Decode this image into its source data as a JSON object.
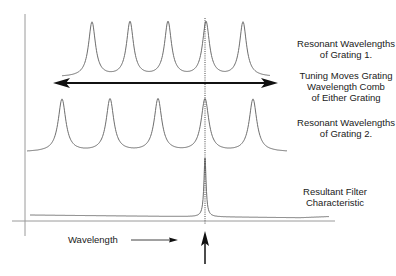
{
  "diagram": {
    "colors": {
      "curve": "#6e6e6e",
      "axis": "#9a9a9a",
      "arrow": "#111111",
      "text": "#1a1a1a"
    },
    "labels": {
      "grating1": [
        "Resonant Wavelengths",
        "of Grating 1."
      ],
      "tuning": [
        "Tuning Moves Grating",
        "Wavelength Comb",
        "of Either Grating"
      ],
      "grating2": [
        "Resonant Wavelengths",
        "of Grating 2."
      ],
      "resultant": [
        "Resultant Filter",
        "Characteristic"
      ],
      "x_axis": "Wavelength"
    },
    "combs": {
      "grating1": {
        "peaks_x": [
          92,
          130,
          168,
          206,
          243
        ],
        "peak_y": 20,
        "base_y": 75,
        "start_x": 62,
        "end_x": 270
      },
      "grating2": {
        "peaks_x": [
          62,
          110,
          158,
          205,
          253
        ],
        "peak_y": 97,
        "base_y": 150,
        "start_x": 27,
        "end_x": 287
      },
      "resultant": {
        "peak_x": 205,
        "peak_y": 158,
        "base_y": 218,
        "start_x": 30,
        "end_x": 329
      }
    },
    "alignment_x": 205,
    "tuning_arrow": {
      "x1": 53,
      "x2": 278,
      "y": 83
    },
    "axes": {
      "y_axis_x": 25,
      "y_top": 14,
      "y_bottom": 236,
      "x_axis_y": 221,
      "x_left": 12,
      "x_right": 335
    }
  }
}
